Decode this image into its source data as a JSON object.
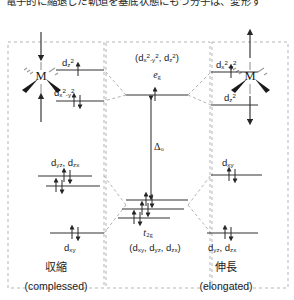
{
  "figure": {
    "caption_clipped": "電子的に縮退した軌道を基底状態にもつ分子は、変形す",
    "type": "orbital-energy-splitting-diagram"
  },
  "colors": {
    "ink": "#1a1a1a",
    "level_line": "#3a3a3a",
    "correlation_line": "#9a9a9a",
    "panel_border": "#b0b0b0",
    "arrow": "#262626"
  },
  "center": {
    "eg_set_label": "(d x²-y², d z²)",
    "eg_symmetry": "e g",
    "t2g_symmetry": "t 2g",
    "t2g_set_label": "(d xy, d yz, d zx)",
    "splitting_label": "Δ o"
  },
  "left_panel": {
    "metal_label": "M",
    "distortion_jp": "収縮",
    "distortion_en": "(complessed)",
    "axis_arrows": "compression along z (arrows point inward)",
    "levels": [
      {
        "name": "dz2",
        "label": "d z²",
        "electrons": 1,
        "spin": "up"
      },
      {
        "name": "dx2-y2",
        "label": "d x²-y²",
        "electrons": 2,
        "spin": "up-down"
      },
      {
        "name": "dyz-dzx",
        "label": "d yz, d zx",
        "electrons": 3,
        "spin": "paired+single"
      },
      {
        "name": "dxy",
        "label": "d xy",
        "electrons": 2,
        "spin": "up-down"
      }
    ]
  },
  "right_panel": {
    "metal_label": "M",
    "distortion_jp": "伸長",
    "distortion_en": "(elongated)",
    "axis_arrows": "elongation along z (arrows point outward)",
    "levels": [
      {
        "name": "dx2-y2",
        "label": "d x²-y²",
        "electrons": 1,
        "spin": "up"
      },
      {
        "name": "dz2",
        "label": "d z²",
        "electrons": 0,
        "spin": "none"
      },
      {
        "name": "dxy",
        "label": "d xy",
        "electrons": 2,
        "spin": "up-down"
      },
      {
        "name": "dyz-dzx",
        "label": "d yz, d zx",
        "electrons": 2,
        "spin": "up-down"
      }
    ]
  }
}
